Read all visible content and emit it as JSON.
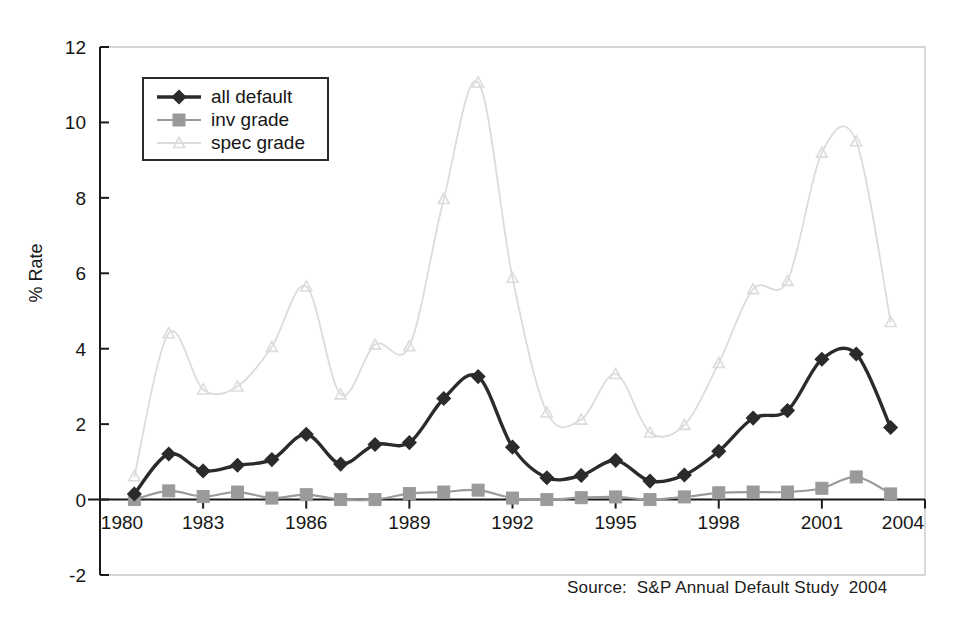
{
  "chart_data": {
    "type": "line",
    "title": "",
    "xlabel": "",
    "ylabel": "% Rate",
    "xlim": [
      1980,
      2004
    ],
    "ylim": [
      -2,
      12
    ],
    "grid": false,
    "legend_position": "top-left",
    "x_tick_labels": [
      "1980",
      "1983",
      "1986",
      "1989",
      "1992",
      "1995",
      "1998",
      "2001",
      "2004"
    ],
    "x_ticks": [
      1980,
      1983,
      1986,
      1989,
      1992,
      1995,
      1998,
      2001,
      2004
    ],
    "y_tick_labels": [
      "-2",
      "0",
      "2",
      "4",
      "6",
      "8",
      "10",
      "12"
    ],
    "y_ticks": [
      -2,
      0,
      2,
      4,
      6,
      8,
      10,
      12
    ],
    "x": [
      1981,
      1982,
      1983,
      1984,
      1985,
      1986,
      1987,
      1988,
      1989,
      1990,
      1991,
      1992,
      1993,
      1994,
      1995,
      1996,
      1997,
      1998,
      1999,
      2000,
      2001,
      2002,
      2003
    ],
    "series": [
      {
        "name": "all default",
        "color": "#2b2b2b",
        "marker": "diamond",
        "values": [
          0.15,
          1.21,
          0.76,
          0.91,
          1.06,
          1.73,
          0.94,
          1.46,
          1.51,
          2.68,
          3.26,
          1.39,
          0.58,
          0.64,
          1.04,
          0.49,
          0.65,
          1.28,
          2.16,
          2.36,
          3.72,
          3.86,
          1.91
        ]
      },
      {
        "name": "inv grade",
        "color": "#9a9a9a",
        "marker": "square",
        "values": [
          0.0,
          0.23,
          0.08,
          0.2,
          0.04,
          0.13,
          0.0,
          0.0,
          0.16,
          0.2,
          0.25,
          0.04,
          0.0,
          0.05,
          0.07,
          0.0,
          0.07,
          0.18,
          0.2,
          0.2,
          0.3,
          0.6,
          0.15
        ]
      },
      {
        "name": "spec grade",
        "color": "#dcdcdc",
        "marker": "triangle",
        "values": [
          0.62,
          4.41,
          2.92,
          3.0,
          4.05,
          5.65,
          2.79,
          4.11,
          4.07,
          7.97,
          11.06,
          5.88,
          2.31,
          2.12,
          3.33,
          1.78,
          1.98,
          3.62,
          5.58,
          5.8,
          9.2,
          9.5,
          4.71
        ]
      }
    ]
  },
  "legend": {
    "items": [
      {
        "label": "all default"
      },
      {
        "label": "inv grade"
      },
      {
        "label": "spec grade"
      }
    ]
  },
  "axes": {
    "y_title": "% Rate"
  },
  "footer": {
    "source_text": "Source:  S&P Annual Default Study  2004"
  }
}
